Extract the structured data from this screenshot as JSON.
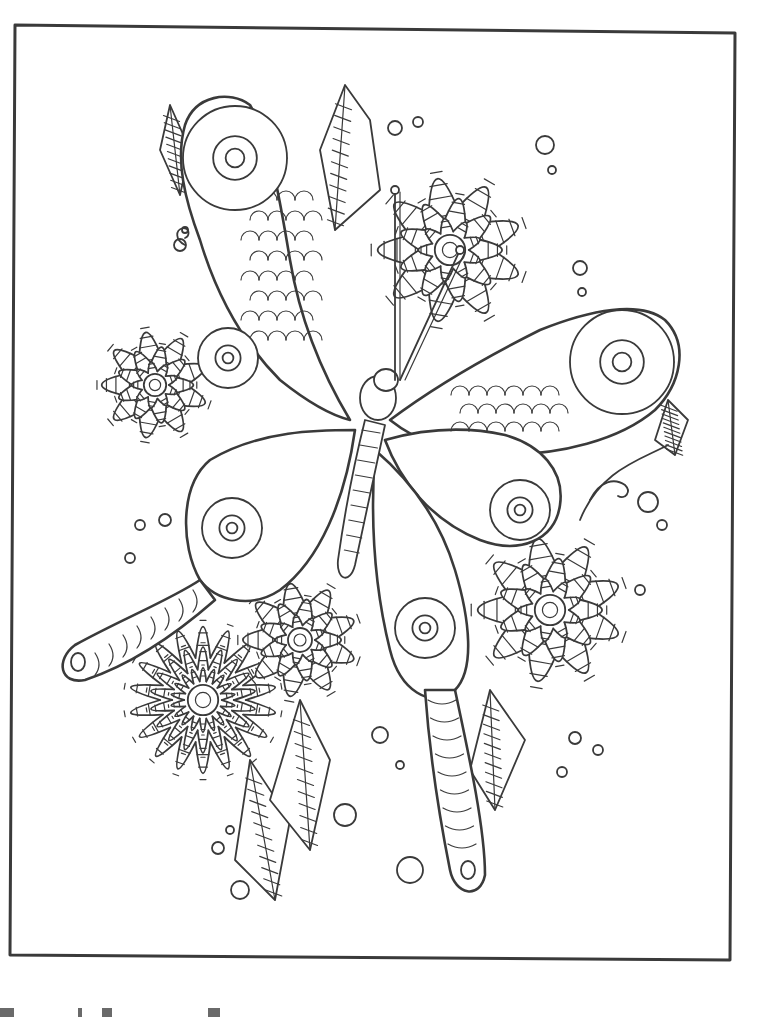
{
  "page": {
    "background": "#ffffff",
    "line_color": "#3a3a3a"
  },
  "frame": {
    "points": [
      [
        15,
        25
      ],
      [
        735,
        33
      ],
      [
        730,
        960
      ],
      [
        10,
        955
      ]
    ],
    "stroke_width": 3
  },
  "butterfly": {
    "body_center": [
      372,
      410
    ],
    "antennae": [
      [
        [
          395,
          380
        ],
        [
          395,
          190
        ]
      ],
      [
        [
          400,
          380
        ],
        [
          460,
          250
        ]
      ]
    ],
    "wings": {
      "upper_left_eye": [
        235,
        158
      ],
      "upper_right_eye": [
        622,
        362
      ],
      "lower_left_eye": [
        232,
        528
      ],
      "lower_right_eye": [
        425,
        628
      ],
      "right_mid_eye": [
        520,
        510
      ],
      "left_mid_eye": [
        228,
        358
      ]
    },
    "tails": {
      "left_tip": [
        70,
        662
      ],
      "right_tip": [
        468,
        882
      ]
    }
  },
  "flowers": [
    {
      "name": "top-right-peony",
      "center": [
        450,
        250
      ],
      "r": 95
    },
    {
      "name": "left-rose",
      "center": [
        155,
        385
      ],
      "r": 70
    },
    {
      "name": "bottom-left-daisy",
      "center": [
        203,
        700
      ],
      "r": 95
    },
    {
      "name": "center-bottom-flower",
      "center": [
        300,
        640
      ],
      "r": 75
    },
    {
      "name": "right-rose",
      "center": [
        550,
        610
      ],
      "r": 95
    }
  ],
  "leaves": [
    {
      "name": "top-leaf",
      "points": [
        [
          345,
          85
        ],
        [
          320,
          150
        ],
        [
          335,
          230
        ],
        [
          380,
          190
        ],
        [
          370,
          120
        ]
      ]
    },
    {
      "name": "left-top-leaf",
      "points": [
        [
          170,
          105
        ],
        [
          160,
          150
        ],
        [
          180,
          195
        ],
        [
          190,
          150
        ]
      ]
    },
    {
      "name": "bottom-leaf-a",
      "points": [
        [
          250,
          760
        ],
        [
          235,
          860
        ],
        [
          275,
          900
        ],
        [
          290,
          820
        ]
      ]
    },
    {
      "name": "bottom-leaf-b",
      "points": [
        [
          300,
          700
        ],
        [
          270,
          800
        ],
        [
          310,
          850
        ],
        [
          330,
          760
        ]
      ]
    },
    {
      "name": "right-leaf",
      "points": [
        [
          490,
          690
        ],
        [
          470,
          770
        ],
        [
          495,
          810
        ],
        [
          525,
          740
        ]
      ]
    },
    {
      "name": "right-bud",
      "points": [
        [
          668,
          400
        ],
        [
          655,
          440
        ],
        [
          675,
          455
        ],
        [
          688,
          420
        ]
      ]
    }
  ],
  "bubbles": [
    [
      395,
      128,
      7
    ],
    [
      418,
      122,
      5
    ],
    [
      545,
      145,
      9
    ],
    [
      552,
      170,
      4
    ],
    [
      580,
      268,
      7
    ],
    [
      582,
      292,
      4
    ],
    [
      165,
      520,
      6
    ],
    [
      140,
      525,
      5
    ],
    [
      130,
      558,
      5
    ],
    [
      648,
      502,
      10
    ],
    [
      662,
      525,
      5
    ],
    [
      640,
      590,
      5
    ],
    [
      380,
      735,
      8
    ],
    [
      400,
      765,
      4
    ],
    [
      345,
      815,
      11
    ],
    [
      410,
      870,
      13
    ],
    [
      218,
      848,
      6
    ],
    [
      230,
      830,
      4
    ],
    [
      575,
      738,
      6
    ],
    [
      598,
      750,
      5
    ],
    [
      562,
      772,
      5
    ],
    [
      240,
      890,
      9
    ],
    [
      180,
      245,
      6
    ],
    [
      185,
      230,
      3
    ]
  ],
  "scan_artifacts": [
    {
      "x": 0,
      "w": 14
    },
    {
      "x": 78,
      "w": 4
    },
    {
      "x": 102,
      "w": 10
    },
    {
      "x": 208,
      "w": 12
    }
  ]
}
